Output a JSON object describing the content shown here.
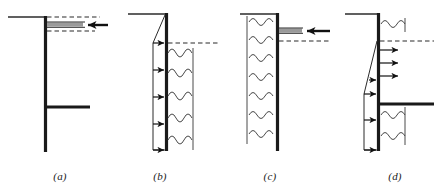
{
  "figure": {
    "background_color": "#ffffff",
    "width": 440,
    "height": 196,
    "colors": {
      "wall": "#1a1a1a",
      "thin_line": "#2b2b2b",
      "dashed_line": "#2b2b2b",
      "arrow": "#111111",
      "gray_band": "#9a9a9a",
      "soil_wave": "#4a4a4a",
      "caption": "#1a1a1a"
    }
  },
  "panels": [
    {
      "id": "a",
      "caption": "(a)",
      "description": "Cantilever wall with ground surface at left, horizontal anchor/strut bar, gray load band and left-pointing load arrow",
      "wall": {
        "x": 45,
        "y_top": 16,
        "y_bottom": 152,
        "thickness": 3
      },
      "ground_line": {
        "x1": 8,
        "x2": 45,
        "y": 17
      },
      "dashed_lines": [
        {
          "x1": 47,
          "x2": 100,
          "y": 17
        },
        {
          "x1": 47,
          "x2": 95,
          "y": 31
        }
      ],
      "gray_band": {
        "x1": 47,
        "x2": 83,
        "y": 24,
        "thickness": 4
      },
      "thin_rules": [
        {
          "x1": 47,
          "x2": 85,
          "y": 22
        },
        {
          "x1": 47,
          "x2": 85,
          "y": 27
        }
      ],
      "load_arrow": {
        "x_tail": 108,
        "x_head": 86,
        "y": 25,
        "direction": "left"
      },
      "strut_bar": {
        "x1": 45,
        "x2": 90,
        "y": 107,
        "thickness": 3
      },
      "arrow_count": 1,
      "wave_rows": 0
    },
    {
      "id": "b",
      "caption": "(b)",
      "description": "Sheet pile wall with triangular-then-rectangular active pressure diagram on the left and soil waves on the right",
      "wall": {
        "x": 166,
        "y_top": 13,
        "y_bottom": 150,
        "thickness": 3
      },
      "ground_line": {
        "x1": 128,
        "x2": 166,
        "y": 14
      },
      "dashed_lines": [
        {
          "x1": 168,
          "x2": 218,
          "y": 43
        }
      ],
      "pressure_outline": {
        "apex_x": 166,
        "apex_y": 15,
        "left_x": 153,
        "start_y": 43,
        "end_y": 150
      },
      "pressure_arrows": [
        {
          "x_tail": 153,
          "x_head": 166,
          "y": 43
        },
        {
          "x_tail": 153,
          "x_head": 166,
          "y": 70
        },
        {
          "x_tail": 153,
          "x_head": 166,
          "y": 97
        },
        {
          "x_tail": 153,
          "x_head": 166,
          "y": 124
        },
        {
          "x_tail": 153,
          "x_head": 166,
          "y": 150
        }
      ],
      "arrow_count": 5,
      "wave_rows": 5,
      "wave_region": {
        "x1": 168,
        "x2": 193,
        "y_top": 50,
        "y_bottom": 148,
        "right_edge_x": 193
      }
    },
    {
      "id": "c",
      "caption": "(c)",
      "description": "Sheet pile wall with soil waves on the left side, gray load band with left-pointing arrow at top right",
      "wall": {
        "x": 277,
        "y_top": 13,
        "y_bottom": 150,
        "thickness": 3
      },
      "ground_line": {
        "x1": 240,
        "x2": 277,
        "y": 14
      },
      "dashed_lines": [
        {
          "x1": 279,
          "x2": 328,
          "y": 41
        }
      ],
      "gray_band": {
        "x1": 279,
        "x2": 302,
        "y": 30,
        "thickness": 4
      },
      "thin_rules": [
        {
          "x1": 279,
          "x2": 303,
          "y": 28
        },
        {
          "x1": 279,
          "x2": 303,
          "y": 33
        }
      ],
      "load_arrow": {
        "x_tail": 328,
        "x_head": 305,
        "y": 31,
        "direction": "left"
      },
      "arrow_count": 1,
      "wave_rows": 7,
      "wave_region": {
        "x1": 247,
        "x2": 275,
        "y_top": 18,
        "y_bottom": 145,
        "left_edge_x": 247
      }
    },
    {
      "id": "d",
      "caption": "(d)",
      "description": "Wall with passive pressure arrows pointing right, triangular pressure diagram on left, horizontal strut bar and soil waves on the right",
      "wall": {
        "x": 378,
        "y_top": 13,
        "y_bottom": 150,
        "thickness": 3
      },
      "ground_line": {
        "x1": 345,
        "x2": 378,
        "y": 14
      },
      "dashed_lines": [
        {
          "x1": 380,
          "x2": 432,
          "y": 41
        }
      ],
      "pressure_outline": {
        "apex_x": 378,
        "apex_y": 41,
        "left_x": 364,
        "start_y": 80,
        "end_y": 150
      },
      "outward_arrows": [
        {
          "x_tail": 378,
          "x_head": 400,
          "y": 50
        },
        {
          "x_tail": 378,
          "x_head": 400,
          "y": 63
        },
        {
          "x_tail": 378,
          "x_head": 400,
          "y": 76
        }
      ],
      "pressure_arrows": [
        {
          "x_tail": 368,
          "x_head": 378,
          "y": 80
        },
        {
          "x_tail": 364,
          "x_head": 378,
          "y": 94
        },
        {
          "x_tail": 364,
          "x_head": 378,
          "y": 120
        },
        {
          "x_tail": 364,
          "x_head": 378,
          "y": 150
        }
      ],
      "strut_bar": {
        "x1": 378,
        "x2": 432,
        "y": 104,
        "thickness": 3
      },
      "arrow_count": 7,
      "wave_rows": 3,
      "wave_region": {
        "x1": 380,
        "x2": 404,
        "y_top": 20,
        "y_bottom": 142,
        "right_edge_x": 404
      }
    }
  ]
}
